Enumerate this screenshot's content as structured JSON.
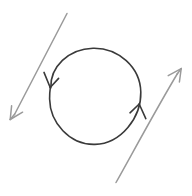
{
  "image": {
    "kind": "hand-drawn-sketch",
    "title": "Circular flow with two opposing diagonal arrows",
    "width": 192,
    "height": 196,
    "background_color": "#ffffff"
  },
  "palette": {
    "ink_dark": "#3a3a3a",
    "ink_grey": "#9a9a9a",
    "paper": "#ffffff"
  },
  "chart_data": {
    "type": "diagram",
    "xlabel": "",
    "ylabel": "",
    "xlim": [
      0,
      192
    ],
    "ylim": [
      0,
      196
    ],
    "grid": false,
    "legend": "none",
    "shapes": [
      {
        "name": "circle-loop",
        "type": "circle",
        "center": [
          95,
          96
        ],
        "radius": 46,
        "stroke": "#3a3a3a",
        "stroke_width": 1.6,
        "fill": "none",
        "direction": "clockwise"
      },
      {
        "name": "circle-arrowhead-left",
        "type": "arrowhead",
        "position": [
          50,
          84
        ],
        "points_toward": "down",
        "stroke": "#3a3a3a"
      },
      {
        "name": "circle-arrowhead-right",
        "type": "arrowhead",
        "position": [
          139,
          104
        ],
        "points_toward": "up",
        "stroke": "#3a3a3a"
      },
      {
        "name": "arrow-down-left",
        "type": "arrow",
        "start": [
          67,
          13
        ],
        "end": [
          10,
          119
        ],
        "points_toward": "down-left",
        "stroke": "#9a9a9a",
        "stroke_width": 1.5
      },
      {
        "name": "arrow-up-right",
        "type": "arrow",
        "start": [
          116,
          182
        ],
        "end": [
          181,
          69
        ],
        "points_toward": "up-right",
        "stroke": "#9a9a9a",
        "stroke_width": 1.5
      }
    ],
    "annotations": []
  }
}
